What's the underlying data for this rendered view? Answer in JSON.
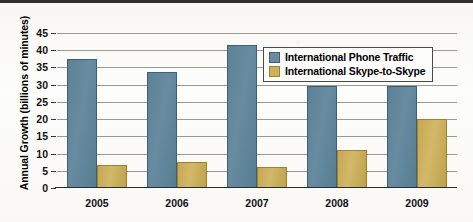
{
  "chart_data": {
    "type": "bar",
    "title": "",
    "xlabel": "",
    "ylabel": "Annual Growth (billions of minutes)",
    "categories": [
      "2005",
      "2006",
      "2007",
      "2008",
      "2009"
    ],
    "series": [
      {
        "name": "International Phone Traffic",
        "color": "#5d8197",
        "values": [
          37,
          33,
          41,
          29,
          29
        ]
      },
      {
        "name": "International Skype-to-Skype",
        "color": "#c6a84f",
        "values": [
          6,
          7,
          5.5,
          10.5,
          19.5
        ]
      }
    ],
    "ylim": [
      0,
      45
    ],
    "ytick_labels": [
      "0",
      "5",
      "10",
      "15",
      "20",
      "25",
      "30",
      "35",
      "40",
      "45"
    ],
    "ytick_values": [
      0,
      5,
      10,
      15,
      20,
      25,
      30,
      35,
      40,
      45
    ],
    "grid": true,
    "legend_position": "upper-center-right"
  },
  "legend": {
    "entries": [
      {
        "label": "International Phone Traffic",
        "swatch": "phone"
      },
      {
        "label": "International Skype-to-Skype",
        "swatch": "skype"
      }
    ]
  }
}
